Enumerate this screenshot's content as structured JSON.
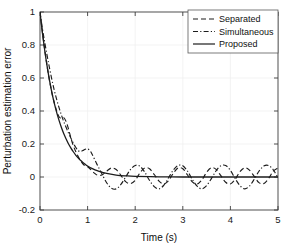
{
  "chart_data": {
    "type": "line",
    "title": "",
    "xlabel": "Time (s)",
    "ylabel": "Perturbation estimation error",
    "xlim": [
      0,
      5
    ],
    "ylim": [
      -0.2,
      1
    ],
    "xticks": [
      "0",
      "1",
      "2",
      "3",
      "4",
      "5"
    ],
    "xtick_values": [
      0,
      1,
      2,
      3,
      4,
      5
    ],
    "yticks": [
      "-0.2",
      "0",
      "0.2",
      "0.4",
      "0.6",
      "0.8",
      "1"
    ],
    "ytick_values": [
      -0.2,
      0,
      0.2,
      0.4,
      0.6,
      0.8,
      1
    ],
    "grid": true,
    "legend_position": "upper right",
    "series": [
      {
        "name": "Separated",
        "style": "dashed",
        "color": "#1c1c1c",
        "description": "Exponential decay from 1 to ~0 by t=1.2 s with a small bump near t=0.5, then persistent low-amplitude oscillation (amplitude about 0.045, period about 0.5 s) about zero for the remainder.",
        "x": [
          0,
          0.05,
          0.1,
          0.15,
          0.2,
          0.25,
          0.3,
          0.35,
          0.4,
          0.45,
          0.5,
          0.55,
          0.6,
          0.65,
          0.7,
          0.75,
          0.8,
          0.85,
          0.9,
          0.95,
          1.0,
          1.05,
          1.1,
          1.15,
          1.2,
          1.3,
          1.4,
          1.5,
          1.6,
          1.7,
          1.8,
          1.9,
          2.0,
          2.1,
          2.2,
          2.3,
          2.4,
          2.5,
          2.6,
          2.7,
          2.8,
          2.9,
          3.0,
          3.1,
          3.2,
          3.3,
          3.4,
          3.5,
          3.6,
          3.7,
          3.8,
          3.9,
          4.0,
          4.1,
          4.2,
          4.3,
          4.4,
          4.5,
          4.6,
          4.7,
          4.8,
          4.9,
          5.0
        ],
        "y": [
          1.0,
          0.88,
          0.77,
          0.67,
          0.585,
          0.51,
          0.45,
          0.4,
          0.365,
          0.355,
          0.36,
          0.335,
          0.29,
          0.235,
          0.19,
          0.155,
          0.125,
          0.1,
          0.08,
          0.068,
          0.062,
          0.05,
          0.035,
          0.022,
          0.012,
          0.012,
          0.035,
          0.055,
          0.045,
          0.01,
          -0.028,
          -0.04,
          -0.02,
          0.025,
          0.055,
          0.05,
          0.015,
          -0.025,
          -0.042,
          -0.022,
          0.022,
          0.055,
          0.05,
          0.012,
          -0.03,
          -0.043,
          -0.018,
          0.028,
          0.056,
          0.046,
          0.008,
          -0.032,
          -0.042,
          -0.014,
          0.032,
          0.056,
          0.042,
          0.004,
          -0.034,
          -0.04,
          -0.01,
          0.035,
          0.055
        ]
      },
      {
        "name": "Simultaneous",
        "style": "dash-dot",
        "color": "#1c1c1c",
        "description": "Slightly slower initial decay than Separated, small plateau bump near t=1.0, then larger persistent oscillation (amplitude about 0.07, period about 1.0 s) about zero.",
        "x": [
          0,
          0.05,
          0.1,
          0.15,
          0.2,
          0.25,
          0.3,
          0.35,
          0.4,
          0.45,
          0.5,
          0.55,
          0.6,
          0.65,
          0.7,
          0.75,
          0.8,
          0.85,
          0.9,
          0.95,
          1.0,
          1.05,
          1.1,
          1.2,
          1.3,
          1.4,
          1.5,
          1.6,
          1.7,
          1.8,
          1.9,
          2.0,
          2.1,
          2.2,
          2.3,
          2.4,
          2.5,
          2.6,
          2.7,
          2.8,
          2.9,
          3.0,
          3.1,
          3.2,
          3.3,
          3.4,
          3.5,
          3.6,
          3.7,
          3.8,
          3.9,
          4.0,
          4.1,
          4.2,
          4.3,
          4.4,
          4.5,
          4.6,
          4.7,
          4.8,
          4.9,
          5.0
        ],
        "y": [
          1.0,
          0.9,
          0.815,
          0.735,
          0.66,
          0.59,
          0.525,
          0.47,
          0.42,
          0.375,
          0.335,
          0.3,
          0.265,
          0.235,
          0.205,
          0.18,
          0.16,
          0.155,
          0.16,
          0.168,
          0.17,
          0.16,
          0.135,
          0.075,
          0.02,
          -0.035,
          -0.068,
          -0.072,
          -0.045,
          0.0,
          0.045,
          0.07,
          0.065,
          0.03,
          -0.02,
          -0.058,
          -0.072,
          -0.05,
          -0.005,
          0.042,
          0.07,
          0.068,
          0.035,
          -0.015,
          -0.055,
          -0.072,
          -0.052,
          -0.01,
          0.038,
          0.068,
          0.07,
          0.04,
          -0.01,
          -0.052,
          -0.072,
          -0.055,
          -0.014,
          0.035,
          0.066,
          0.07,
          0.044,
          -0.005
        ]
      },
      {
        "name": "Proposed",
        "style": "solid",
        "color": "#1c1c1c",
        "description": "Smooth monotone exponential decay from 1 to zero by about t=1.3 s, then flat at zero with no oscillation.",
        "x": [
          0,
          0.05,
          0.1,
          0.15,
          0.2,
          0.25,
          0.3,
          0.35,
          0.4,
          0.45,
          0.5,
          0.55,
          0.6,
          0.65,
          0.7,
          0.75,
          0.8,
          0.85,
          0.9,
          0.95,
          1.0,
          1.1,
          1.2,
          1.3,
          1.4,
          1.6,
          1.8,
          2.0,
          2.5,
          3.0,
          3.5,
          4.0,
          4.5,
          5.0
        ],
        "y": [
          1.0,
          0.875,
          0.765,
          0.67,
          0.585,
          0.512,
          0.448,
          0.392,
          0.343,
          0.3,
          0.262,
          0.23,
          0.2,
          0.175,
          0.153,
          0.133,
          0.116,
          0.101,
          0.088,
          0.077,
          0.067,
          0.051,
          0.038,
          0.029,
          0.022,
          0.012,
          0.007,
          0.004,
          0.001,
          0.0,
          0.0,
          0.0,
          0.0,
          0.0
        ]
      }
    ]
  },
  "axes": {
    "xlabel": "Time (s)",
    "ylabel": "Perturbation estimation error"
  },
  "legend": {
    "entries": [
      {
        "label": "Separated"
      },
      {
        "label": "Simultaneous"
      },
      {
        "label": "Proposed"
      }
    ]
  },
  "colors": {
    "line": "#1c1c1c",
    "axis": "#3d3d3d",
    "grid": "#f0f0f0",
    "background": "#ffffff"
  }
}
